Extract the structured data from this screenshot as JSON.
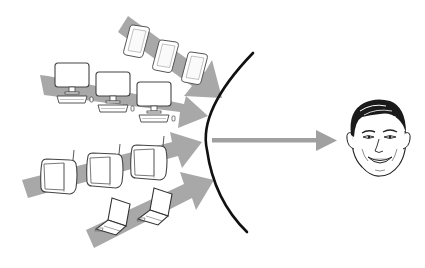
{
  "diagram": {
    "title": "Multiple devices converging to one person",
    "colors": {
      "background": "#ffffff",
      "arrow": "#a8a8a8",
      "lens": "#111111",
      "outline": "#3a3a3a",
      "device_fill": "#ffffff"
    },
    "streams": [
      {
        "name": "phones",
        "device": "smartphone-icon",
        "count": 3
      },
      {
        "name": "desktops",
        "device": "desktop-computer-icon",
        "count": 3
      },
      {
        "name": "televisions",
        "device": "television-icon",
        "count": 3
      },
      {
        "name": "laptops",
        "device": "laptop-icon",
        "count": 2
      }
    ],
    "lens": {
      "shape": "curved-arc"
    },
    "output_arrow": {
      "direction": "right"
    },
    "target": {
      "icon": "person-face-icon",
      "label": ""
    }
  }
}
